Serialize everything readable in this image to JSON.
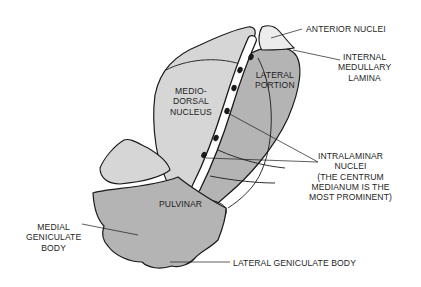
{
  "diagram": {
    "colors": {
      "light_region": "#d6d6d6",
      "dark_region": "#b4b4b4",
      "outline": "#1a1a1a",
      "lamina": "#ffffff",
      "nucleus_dots": "#1a1a1a",
      "text": "#1e1e1e"
    },
    "regions": {
      "medio_dorsal": [
        "MEDIO-",
        "DORSAL",
        "NUCLEUS"
      ],
      "lateral_portion": [
        "LATERAL",
        "PORTION"
      ],
      "pulvinar": [
        "PULVINAR"
      ]
    },
    "callouts": {
      "anterior_nuclei": [
        "ANTERIOR NUCLEI"
      ],
      "internal_medullary_lamina": [
        "INTERNAL",
        "MEDULLARY",
        "LAMINA"
      ],
      "intralaminar_nuclei": [
        "INTRALAMINAR",
        "NUCLEI",
        "(THE CENTRUM",
        "MEDIANUM IS THE",
        "MOST PROMINENT)"
      ],
      "medial_geniculate_body": [
        "MEDIAL",
        "GENICULATE",
        "BODY"
      ],
      "lateral_geniculate_body": [
        "LATERAL GENICULATE BODY"
      ]
    },
    "intralaminar_dot_count": 6
  }
}
